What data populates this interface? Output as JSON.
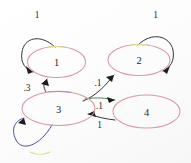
{
  "diagram": {
    "kind": "state-transition-diagram",
    "title": "",
    "background_color": "#fdfdfd",
    "node_stroke_color": "#d99aa4",
    "edge_stroke_color": "#2b2b2b",
    "label_color": "#2a2a2a"
  },
  "nodes": [
    {
      "id": "1",
      "label": "1",
      "cx": 56.5,
      "cy": 62.0,
      "rx": 29.0,
      "ry": 15.5
    },
    {
      "id": "2",
      "label": "2",
      "cx": 139.0,
      "cy": 60.0,
      "rx": 31.0,
      "ry": 15.5
    },
    {
      "id": "3",
      "label": "3",
      "cx": 58.5,
      "cy": 108.5,
      "rx": 36.5,
      "ry": 17.0
    },
    {
      "id": "4",
      "label": "4",
      "cx": 146.5,
      "cy": 111.5,
      "rx": 33.5,
      "ry": 16.5
    }
  ],
  "edges": [
    {
      "id": "e-1-1",
      "from": "1",
      "to": "1",
      "type": "self-loop",
      "label": "1",
      "label_x": 37.0,
      "label_y": 15.0
    },
    {
      "id": "e-2-2",
      "from": "2",
      "to": "2",
      "type": "self-loop",
      "label": "1",
      "label_x": 155.5,
      "label_y": 15.0
    },
    {
      "id": "e-3-3",
      "from": "3",
      "to": "3",
      "type": "self-loop",
      "label": "",
      "label_x": 39.0,
      "label_y": 160.0
    },
    {
      "id": "e-3-1",
      "from": "3",
      "to": "1",
      "type": "arc",
      "label": ".3",
      "label_x": 27.0,
      "label_y": 88.0
    },
    {
      "id": "e-3-2",
      "from": "3",
      "to": "2",
      "type": "arc",
      "label": ".1",
      "label_x": 98.0,
      "label_y": 83.0
    },
    {
      "id": "e-3-4",
      "from": "3",
      "to": "4",
      "type": "arc",
      "label": ".1",
      "label_x": 99.5,
      "label_y": 106.0
    },
    {
      "id": "e-4-3",
      "from": "4",
      "to": "3",
      "type": "arc",
      "label": "1",
      "label_x": 99.5,
      "label_y": 124.5
    }
  ]
}
